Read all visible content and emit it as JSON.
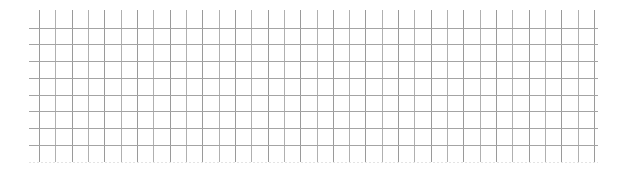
{
  "grid": {
    "background": "#ffffff",
    "vertical_lines": {
      "count": 35,
      "x_start": 39,
      "x_end": 594,
      "y_top": 10,
      "y_bottom": 162,
      "color": "#9a9a9a",
      "alt_color": "#b0b0b0"
    },
    "horizontal_lines": {
      "count": 8,
      "y_start": 27.5,
      "y_end": 145,
      "x_left": 29,
      "x_right": 598,
      "color": "#a4a4a4"
    },
    "bottom_faint_line": {
      "y": 162,
      "x_left": 29,
      "x_right": 598,
      "color": "#e4e4e4"
    }
  }
}
